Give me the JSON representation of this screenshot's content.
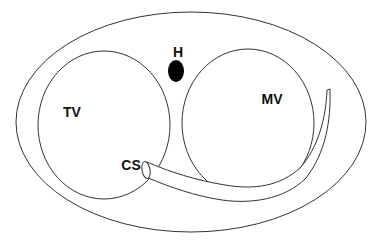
{
  "diagram": {
    "type": "anatomical-schematic",
    "labels": {
      "h": "H",
      "tv": "TV",
      "mv": "MV",
      "cs": "CS"
    },
    "colors": {
      "stroke": "#333333",
      "fill_dark": "#000000",
      "background": "#ffffff",
      "text": "#111111"
    }
  }
}
